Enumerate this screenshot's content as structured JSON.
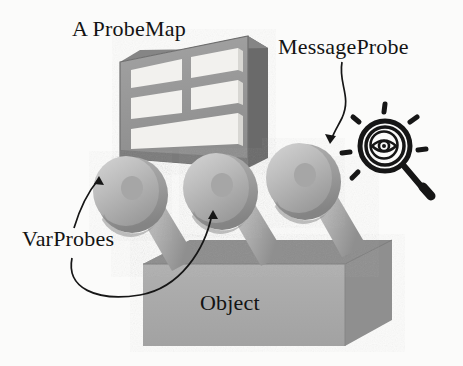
{
  "figure": {
    "background_color": "#fbfbfa",
    "labels": {
      "probemap": "A ProbeMap",
      "message_probe": "MessageProbe",
      "var_probes": "VarProbes",
      "object": "Object"
    },
    "colors": {
      "background": "#fbfbfa",
      "text": "#131313",
      "probemap_front": "#9a9a9a",
      "probemap_cell": "#f4f4f2",
      "probemap_side": "#6f6f6f",
      "probemap_top": "#8a8a8a",
      "probe_light": "#c8c8c8",
      "probe_mid": "#b0b0b0",
      "probe_dark": "#8e8e8e",
      "object_front": "#a8a8a8",
      "object_top": "#949494",
      "object_side": "#8d8d8d",
      "ink": "#1a1a1a"
    },
    "parts": {
      "probemap": {
        "name": "A ProbeMap",
        "shape": "3d-grid-frame",
        "rows": 3,
        "top_rows_columns": 2
      },
      "probes": [
        {
          "name": "VarProbe",
          "index": 1,
          "kind": "var-probe"
        },
        {
          "name": "VarProbe",
          "index": 2,
          "kind": "var-probe"
        },
        {
          "name": "MessageProbe",
          "index": 3,
          "kind": "message-probe"
        }
      ],
      "object": {
        "name": "Object",
        "shape": "3d-slab"
      },
      "eye_glass": {
        "name": "magnifying-glass-eye",
        "rays": 6
      }
    },
    "annotations": [
      {
        "name": "varprobes-arrow-left",
        "from": "VarProbes label",
        "to": "left probe"
      },
      {
        "name": "varprobes-arrow-right",
        "from": "VarProbes label",
        "to": "middle probe"
      },
      {
        "name": "messageprobe-arrow",
        "from": "MessageProbe label",
        "to": "right probe"
      }
    ]
  }
}
